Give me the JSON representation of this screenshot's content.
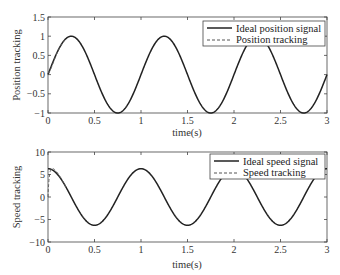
{
  "chart_data": [
    {
      "type": "line",
      "title": "",
      "xlabel": "time(s)",
      "ylabel": "Position tracking",
      "xlim": [
        0,
        3
      ],
      "ylim": [
        -1,
        1.5
      ],
      "xticks": [
        "0",
        "0.5",
        "1",
        "1.5",
        "2",
        "2.5",
        "3"
      ],
      "yticks": [
        "−1",
        "−0.5",
        "0",
        "0.5",
        "1",
        "1.5"
      ],
      "grid": false,
      "legend_position": "upper right",
      "series": [
        {
          "name": "Ideal position signal",
          "style": "solid",
          "formula": "sin(2*pi*t)",
          "x": [
            0,
            0.25,
            0.5,
            0.75,
            1,
            1.25,
            1.5,
            1.75,
            2,
            2.25,
            2.5,
            2.75,
            3
          ],
          "values": [
            0,
            1,
            0,
            -1,
            0,
            1,
            0,
            -1,
            0,
            1,
            0,
            -1,
            0
          ]
        },
        {
          "name": "Position tracking",
          "style": "dashed",
          "x": [
            0,
            0.05,
            0.1,
            0.15,
            0.2,
            0.25,
            0.5,
            1,
            3
          ],
          "values": [
            0.05,
            0.35,
            0.62,
            0.83,
            0.96,
            1,
            0,
            0,
            0
          ]
        }
      ]
    },
    {
      "type": "line",
      "title": "",
      "xlabel": "time(s)",
      "ylabel": "Speed tracking",
      "xlim": [
        0,
        3
      ],
      "ylim": [
        -10,
        10
      ],
      "xticks": [
        "0",
        "0.5",
        "1",
        "1.5",
        "2",
        "2.5",
        "3"
      ],
      "yticks": [
        "−10",
        "−5",
        "0",
        "5",
        "10"
      ],
      "grid": false,
      "legend_position": "upper right",
      "series": [
        {
          "name": "Ideal speed signal",
          "style": "solid",
          "formula": "2*pi*cos(2*pi*t)",
          "x": [
            0,
            0.25,
            0.5,
            0.75,
            1,
            1.25,
            1.5,
            1.75,
            2,
            2.25,
            2.5,
            2.75,
            3
          ],
          "values": [
            6.28,
            0,
            -6.28,
            0,
            6.28,
            0,
            -6.28,
            0,
            6.28,
            0,
            -6.28,
            0,
            6.28
          ]
        },
        {
          "name": "Speed tracking",
          "style": "dashed",
          "x": [
            0,
            0.02,
            0.05,
            0.08,
            0.12,
            0.2
          ],
          "values": [
            0,
            5.5,
            6.8,
            6.5,
            4.8,
            2
          ]
        }
      ]
    }
  ],
  "plots": {
    "top": {
      "ylabel": "Position tracking",
      "xlabel": "time(s)",
      "legend": [
        "Ideal position signal",
        "Position tracking"
      ],
      "xticks": [
        "0",
        "0.5",
        "1",
        "1.5",
        "2",
        "2.5",
        "3"
      ],
      "yticks": [
        "1.5",
        "1",
        "0.5",
        "0",
        "−0.5",
        "−1"
      ]
    },
    "bottom": {
      "ylabel": "Speed tracking",
      "xlabel": "time(s)",
      "legend": [
        "Ideal speed signal",
        "Speed tracking"
      ],
      "xticks": [
        "0",
        "0.5",
        "1",
        "1.5",
        "2",
        "2.5",
        "3"
      ],
      "yticks": [
        "10",
        "5",
        "0",
        "−5",
        "−10"
      ]
    }
  }
}
